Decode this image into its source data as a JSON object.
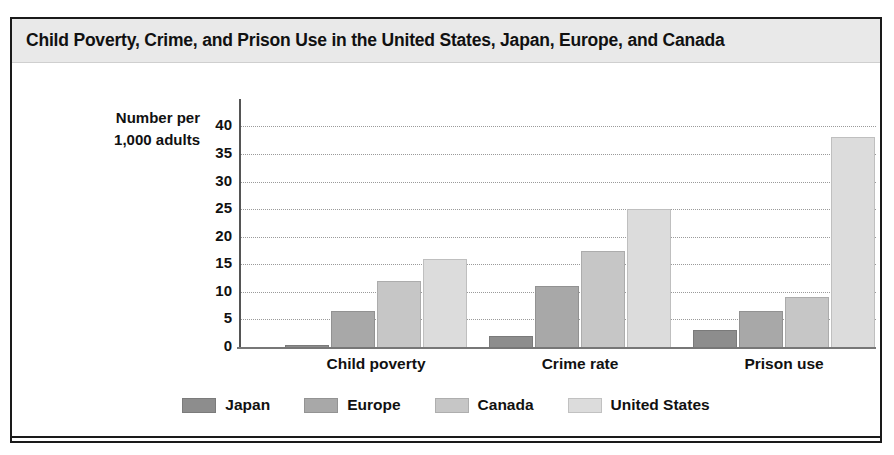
{
  "figure": {
    "title": "Child Poverty, Crime, and Prison Use in the United States, Japan, Europe, and Canada",
    "axis_label_line1": "Number per",
    "axis_label_line2": "1,000 adults"
  },
  "chart_data": {
    "type": "bar",
    "title": "Child Poverty, Crime, and Prison Use in the United States, Japan, Europe, and Canada",
    "xlabel": "",
    "ylabel": "Number per 1,000 adults",
    "ylim": [
      0,
      40
    ],
    "ytick_values": [
      40,
      35,
      30,
      25,
      20,
      15,
      10,
      5,
      0
    ],
    "ytick_labels": [
      "40",
      "35",
      "30",
      "25",
      "20",
      "15",
      "10",
      "5",
      "0"
    ],
    "grid": true,
    "grid_style": "dotted-horizontal",
    "legend_position": "bottom-center",
    "categories": [
      "Child poverty",
      "Crime rate",
      "Prison use"
    ],
    "series": [
      {
        "name": "Japan",
        "color": "#8d8d8d",
        "values": [
          0.3,
          2,
          3
        ]
      },
      {
        "name": "Europe",
        "color": "#a8a8a8",
        "values": [
          6.5,
          11,
          6.5
        ]
      },
      {
        "name": "Canada",
        "color": "#c6c6c6",
        "values": [
          12,
          17.5,
          9
        ]
      },
      {
        "name": "United States",
        "color": "#dcdcdc",
        "values": [
          16,
          25,
          38
        ]
      }
    ]
  }
}
